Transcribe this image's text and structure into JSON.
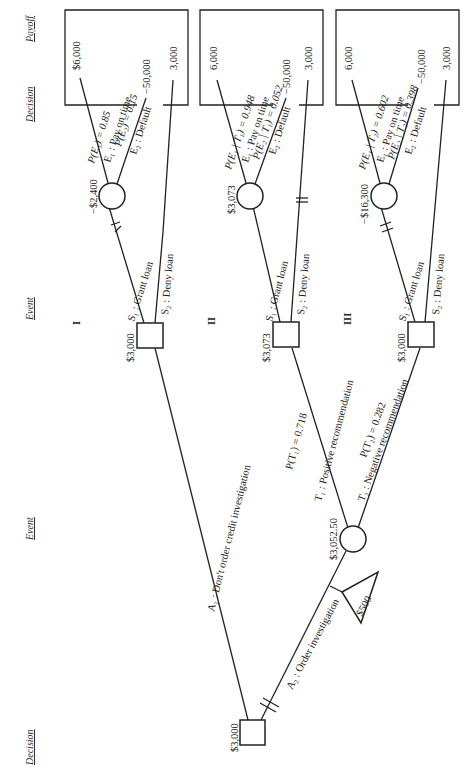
{
  "headers": {
    "decision_left": "Decision",
    "event_left": "Event",
    "decision_right": "Decision",
    "event_right": "Event",
    "payoff": "Payoff"
  },
  "root": {
    "value": "$3,000",
    "a1_label": "A₁ : Don't order credit investigation",
    "a2_label": "A₂ : Order investigation",
    "cost": "$500"
  },
  "investigation_event": {
    "value": "$3,052.50",
    "t1_label": "T₁ : Positive recommendation",
    "t1_prob": "P(T₁) = 0.718",
    "t2_label": "T₂ : Negative recommendation",
    "t2_prob": "P(T₂) = 0.282"
  },
  "boxes": [
    {
      "id": "I",
      "decision_value": "$3,000",
      "s1_label": "S₁ : Grant loan",
      "s2_label": "S₂ : Deny loan",
      "event_value": "−$2,400",
      "e1_prob": "P(E₁) = 0.85",
      "e1_label": "E₁ : Pay on time",
      "e2_prob": "P(E₂) = 0.15",
      "e2_label": "E₂ : Default",
      "payoff_e1": "$6,000",
      "payoff_e2": "−50,000",
      "payoff_deny": "3,000"
    },
    {
      "id": "II",
      "decision_value": "$3,073",
      "s1_label": "S₁ : Grant loan",
      "s2_label": "S₂ : Deny loan",
      "event_value": "$3,073",
      "e1_prob": "P(E₁ | T₁) = 0.948",
      "e1_label": "E₁ : Pay on time",
      "e2_prob": "P(E₂ | T₁) = 0.052",
      "e2_label": "E₂ : Default",
      "payoff_e1": "6,000",
      "payoff_e2": "−50,000",
      "payoff_deny": "3,000"
    },
    {
      "id": "III",
      "decision_value": "$3,000",
      "s1_label": "S₁ : Grant loan",
      "s2_label": "S₂ : Deny loan",
      "event_value": "−$16,300",
      "e1_prob": "P(E₁ | T₂) = 0.602",
      "e1_label": "E₁ : Pay on time",
      "e2_prob": "P(E₂ | T₂) = 0.398",
      "e2_label": "E₂ : Default",
      "payoff_e1": "6,000",
      "payoff_e2": "−50,000",
      "payoff_deny": "3,000"
    }
  ]
}
